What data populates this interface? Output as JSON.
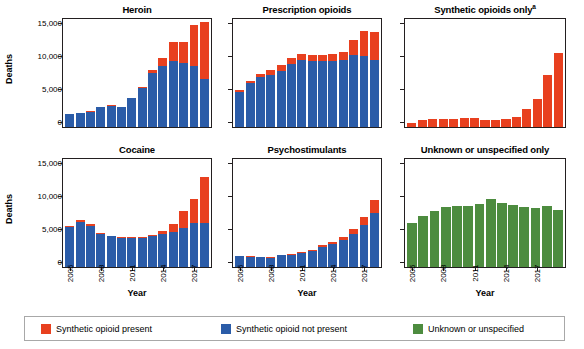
{
  "chart_data": {
    "type": "bar",
    "title": "",
    "subplot_layout": "2 rows x 3 columns, stacked bars",
    "xlabel": "Year",
    "ylabel": "Deaths",
    "ylim": [
      0,
      16500
    ],
    "yticks": [
      0,
      5000,
      10000,
      15000
    ],
    "ytick_labels": [
      "0",
      "5,000",
      "10,000",
      "15,000"
    ],
    "grid": false,
    "legend_position": "bottom",
    "x": [
      2005,
      2006,
      2007,
      2008,
      2009,
      2010,
      2011,
      2012,
      2013,
      2014,
      2015,
      2016,
      2017,
      2018
    ],
    "xtick_values": [
      2005,
      2008,
      2011,
      2014,
      2017
    ],
    "xtick_labels": [
      "2005",
      "2008",
      "2011",
      "2014",
      "2017"
    ],
    "series_names": [
      "Synthetic opioid present",
      "Synthetic opioid not present",
      "Unknown or unspecified"
    ],
    "series_colors": [
      "#e8401f",
      "#2b5ca8",
      "#4d8c3f"
    ],
    "panels": [
      {
        "title": "Heroin",
        "title_superscript": "",
        "series": [
          {
            "name": "Synthetic opioid not present",
            "color": "#2b5ca8",
            "values": [
              2000,
              2080,
              2340,
              3040,
              3280,
              3000,
              4400,
              5950,
              8250,
              9250,
              10150,
              9850,
              9350,
              7400
            ]
          },
          {
            "name": "Synthetic opioid present",
            "color": "#e8401f",
            "values": [
              0,
              120,
              60,
              30,
              60,
              60,
              60,
              120,
              400,
              1300,
              2850,
              3150,
              6250,
              8600
            ]
          }
        ],
        "totals": [
          2000,
          2200,
          2400,
          3070,
          3340,
          3060,
          4460,
          6070,
          8650,
          10550,
          13000,
          13000,
          15600,
          16000
        ]
      },
      {
        "title": "Prescription opioids",
        "title_superscript": "",
        "series": [
          {
            "name": "Synthetic opioid not present",
            "color": "#2b5ca8",
            "values": [
              5300,
              6700,
              7600,
              8000,
              8600,
              9600,
              10200,
              10100,
              10050,
              10100,
              10300,
              10950,
              10900,
              10250
            ]
          },
          {
            "name": "Synthetic opioid present",
            "color": "#e8401f",
            "values": [
              300,
              400,
              450,
              700,
              800,
              900,
              1000,
              900,
              900,
              1000,
              1200,
              2300,
              3700,
              4300
            ]
          }
        ],
        "totals": [
          5600,
          7100,
          8050,
          8700,
          9400,
          10500,
          11200,
          11000,
          10950,
          11100,
          11500,
          13250,
          14600,
          14550
        ]
      },
      {
        "title": "Synthetic opioids only",
        "title_superscript": "a",
        "series": [
          {
            "name": "Synthetic opioid present",
            "color": "#e8401f",
            "values": [
              650,
              1050,
              1200,
              1150,
              1300,
              1400,
              1350,
              1000,
              1050,
              1200,
              1500,
              2700,
              4300,
              7900,
              11300
            ]
          }
        ],
        "totals": [
          650,
          1050,
          1200,
          1150,
          1300,
          1400,
          1350,
          1000,
          1050,
          1200,
          1500,
          2700,
          4300,
          7900,
          11300
        ]
      },
      {
        "title": "Cocaine",
        "title_superscript": "",
        "series": [
          {
            "name": "Synthetic opioid not present",
            "color": "#2b5ca8",
            "values": [
              6100,
              6900,
              6300,
              5050,
              4700,
              4400,
              4500,
              4400,
              4700,
              5000,
              5300,
              6000,
              6800,
              6800
            ]
          },
          {
            "name": "Synthetic opioid present",
            "color": "#e8401f",
            "values": [
              150,
              300,
              200,
              150,
              100,
              150,
              100,
              150,
              200,
              550,
              1200,
              2600,
              3600,
              7000
            ]
          }
        ],
        "totals": [
          6250,
          7200,
          6500,
          5200,
          4800,
          4550,
          4600,
          4550,
          4900,
          5550,
          6500,
          8600,
          10400,
          13800
        ]
      },
      {
        "title": "Psychostimulants",
        "title_superscript": "",
        "series": [
          {
            "name": "Synthetic opioid not present",
            "color": "#2b5ca8",
            "values": [
              1700,
              1600,
              1550,
              1450,
              1800,
              1900,
              2200,
              2500,
              3100,
              3500,
              4100,
              5100,
              6400,
              8300
            ]
          },
          {
            "name": "Synthetic opioid present",
            "color": "#e8401f",
            "values": [
              30,
              30,
              30,
              30,
              30,
              50,
              50,
              50,
              200,
              300,
              450,
              700,
              1300,
              2000
            ]
          }
        ],
        "totals": [
          1730,
          1630,
          1580,
          1480,
          1830,
          1950,
          2250,
          2550,
          3300,
          3800,
          4550,
          5800,
          7700,
          10300
        ]
      },
      {
        "title": "Unknown or unspecified only",
        "title_superscript": "",
        "series": [
          {
            "name": "Unknown or unspecified",
            "color": "#4d8c3f",
            "values": [
              6700,
              7800,
              8600,
              9200,
              9300,
              9300,
              9600,
              10350,
              9750,
              9550,
              9200,
              9000,
              9300,
              8750
            ]
          }
        ],
        "totals": [
          6700,
          7800,
          8600,
          9200,
          9300,
          9300,
          9600,
          10350,
          9750,
          9550,
          9200,
          9000,
          9300,
          8750
        ]
      }
    ]
  },
  "axes": {
    "ylabel": "Deaths",
    "xlabel": "Year",
    "ytick_labels": [
      "15,000",
      "10,000",
      "5,000",
      "0"
    ],
    "xtick_labels": [
      "2005",
      "2008",
      "2011",
      "2014",
      "2017"
    ]
  },
  "legend": {
    "items": [
      {
        "label": "Synthetic opioid present",
        "color": "#e8401f"
      },
      {
        "label": "Synthetic opioid not present",
        "color": "#2b5ca8"
      },
      {
        "label": "Unknown or unspecified",
        "color": "#4d8c3f"
      }
    ]
  },
  "panel_titles": {
    "heroin": "Heroin",
    "prescription": "Prescription opioids",
    "synthetic": "Synthetic opioids only",
    "synthetic_sup": "a",
    "cocaine": "Cocaine",
    "psychostimulants": "Psychostimulants",
    "unknown": "Unknown or unspecified only"
  }
}
